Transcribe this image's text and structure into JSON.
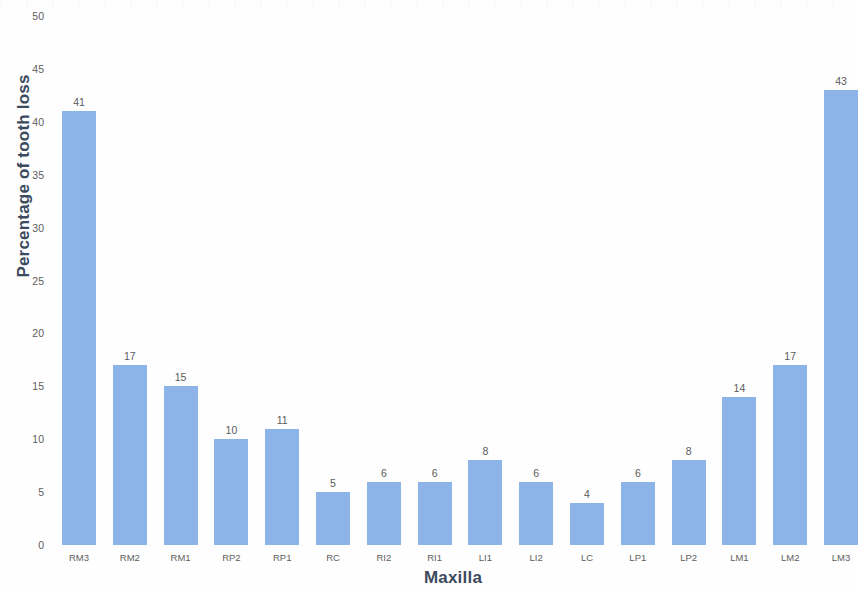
{
  "chart_data": {
    "type": "bar",
    "title": "",
    "xlabel": "Maxilla",
    "ylabel": "Percentage of tooth loss",
    "categories": [
      "RM3",
      "RM2",
      "RM1",
      "RP2",
      "RP1",
      "RC",
      "RI2",
      "RI1",
      "LI1",
      "LI2",
      "LC",
      "LP1",
      "LP2",
      "LM1",
      "LM2",
      "LM3"
    ],
    "values": [
      41,
      17,
      15,
      10,
      11,
      5,
      6,
      6,
      8,
      6,
      4,
      6,
      8,
      14,
      17,
      43
    ],
    "ylim": [
      0,
      50
    ],
    "ytick_step": 5,
    "yticks": [
      0,
      5,
      10,
      15,
      20,
      25,
      30,
      35,
      40,
      45,
      50
    ],
    "grid": false,
    "legend": false,
    "data_labels": true,
    "bar_color": "#8db4e8",
    "axis_title_color": "#3c4a5e",
    "tick_label_color": "#5d5d5d",
    "data_label_color": "#5a5a5a",
    "background_color": "#fefefe"
  }
}
